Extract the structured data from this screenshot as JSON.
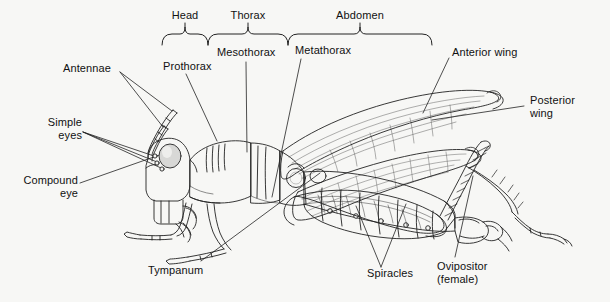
{
  "figure": {
    "view": "lateral",
    "background_color": "#f7f7f5",
    "ink_color": "#1a1a1a",
    "line_color": "#222222"
  },
  "body_regions": [
    {
      "id": "head",
      "label": "Head",
      "bracket_x1": 162,
      "bracket_x2": 208,
      "tick_x": 185
    },
    {
      "id": "thorax",
      "label": "Thorax",
      "bracket_x1": 208,
      "bracket_x2": 288,
      "tick_x": 248
    },
    {
      "id": "abdomen",
      "label": "Abdomen",
      "bracket_x1": 288,
      "bracket_x2": 432,
      "tick_x": 360
    }
  ],
  "bracket": {
    "label_baseline_y": 22,
    "rail_y": 34,
    "tick_top_y": 27,
    "end_drop_y": 45,
    "cusp_y": 45
  },
  "labels": [
    {
      "id": "head",
      "text": "Head",
      "x": 185,
      "y": 15,
      "align": "center"
    },
    {
      "id": "thorax",
      "text": "Thorax",
      "x": 248,
      "y": 15,
      "align": "center"
    },
    {
      "id": "abdomen",
      "text": "Abdomen",
      "x": 360,
      "y": 15,
      "align": "center"
    },
    {
      "id": "prothorax",
      "text": "Prothorax",
      "x": 163,
      "y": 66,
      "align": "left"
    },
    {
      "id": "mesothorax",
      "text": "Mesothorax",
      "x": 217,
      "y": 52,
      "align": "left"
    },
    {
      "id": "metathorax",
      "text": "Metathorax",
      "x": 295,
      "y": 50,
      "align": "left"
    },
    {
      "id": "anterior-wing",
      "text": "Anterior wing",
      "x": 452,
      "y": 52,
      "align": "left"
    },
    {
      "id": "posterior-wing",
      "text": "Posterior\nwing",
      "x": 530,
      "y": 100,
      "align": "left"
    },
    {
      "id": "antennae",
      "text": "Antennae",
      "x": 63,
      "y": 68,
      "align": "left"
    },
    {
      "id": "simple-eyes",
      "text": "Simple\neyes",
      "x": 45,
      "y": 122,
      "align": "left"
    },
    {
      "id": "compound-eye",
      "text": "Compound\neye",
      "x": 26,
      "y": 180,
      "align": "left"
    },
    {
      "id": "tympanum",
      "text": "Tympanum",
      "x": 148,
      "y": 270,
      "align": "left"
    },
    {
      "id": "spiracles",
      "text": "Spiracles",
      "x": 367,
      "y": 273,
      "align": "left"
    },
    {
      "id": "ovipositor",
      "text": "Ovipositor\n(female)",
      "x": 437,
      "y": 266,
      "align": "left"
    }
  ],
  "leader_lines": [
    {
      "from": "antennae",
      "points": "120,72 172,111"
    },
    {
      "from": "antennae",
      "points": "120,72 163,127"
    },
    {
      "from": "simple-eyes",
      "points": "83,132 154,155"
    },
    {
      "from": "simple-eyes",
      "points": "83,132 156,161"
    },
    {
      "from": "simple-eyes",
      "points": "83,132 160,167"
    },
    {
      "from": "compound-eye",
      "points": "80,183 168,152"
    },
    {
      "from": "prothorax",
      "points": "186,74 217,140"
    },
    {
      "from": "mesothorax",
      "points": "246,61 246,152"
    },
    {
      "from": "metathorax",
      "points": "300,58 273,196"
    },
    {
      "from": "anterior-wing",
      "points": "449,57 424,112"
    },
    {
      "from": "posterior-wing",
      "points": "524,106 433,120"
    },
    {
      "from": "tympanum",
      "points": "200,262 320,173"
    },
    {
      "from": "spiracles",
      "points": "381,268 356,206"
    },
    {
      "from": "spiracles",
      "points": "381,268 406,204"
    },
    {
      "from": "ovipositor",
      "points": "455,258 472,175"
    }
  ],
  "anatomy_parts": [
    "antenna-upper",
    "antenna-lower",
    "simple-eye-1",
    "simple-eye-2",
    "simple-eye-3",
    "compound-eye",
    "head-capsule",
    "mouthparts",
    "prothorax-segment",
    "mesothorax-segment",
    "metathorax-segment",
    "anterior-wing",
    "posterior-wing",
    "abdomen-segments",
    "spiracle-circles",
    "tympanum",
    "ovipositor",
    "foreleg",
    "midleg",
    "hindleg-femur",
    "hindleg-tibia",
    "hindleg-tarsus"
  ]
}
